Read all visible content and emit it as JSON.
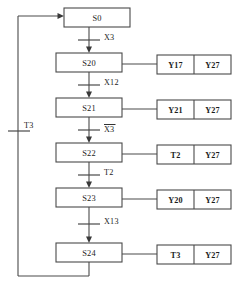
{
  "diagram": {
    "type": "sequential-function-chart",
    "title": "",
    "states": [
      {
        "id": "s0",
        "label": "S0",
        "x": 64,
        "y": 8,
        "w": 66,
        "h": 19
      },
      {
        "id": "s20",
        "label": "S20",
        "x": 56,
        "y": 53,
        "w": 66,
        "h": 19
      },
      {
        "id": "s21",
        "label": "S21",
        "x": 56,
        "y": 98,
        "w": 66,
        "h": 19
      },
      {
        "id": "s22",
        "label": "S22",
        "x": 56,
        "y": 143,
        "w": 66,
        "h": 19
      },
      {
        "id": "s23",
        "label": "S23",
        "x": 56,
        "y": 188,
        "w": 66,
        "h": 19
      },
      {
        "id": "s24",
        "label": "S24",
        "x": 56,
        "y": 243,
        "w": 66,
        "h": 19
      }
    ],
    "transitions": [
      {
        "id": "t-s0-s20",
        "label": "X3",
        "overbar": false,
        "bar_y": 40,
        "label_x": 104,
        "label_y": 40
      },
      {
        "id": "t-s20-s21",
        "label": "X12",
        "overbar": false,
        "bar_y": 85,
        "label_x": 104,
        "label_y": 85
      },
      {
        "id": "t-s21-s22",
        "label": "X3",
        "overbar": true,
        "bar_y": 130,
        "label_x": 104,
        "label_y": 131
      },
      {
        "id": "t-s22-s23",
        "label": "T2",
        "overbar": false,
        "bar_y": 175,
        "label_x": 104,
        "label_y": 175
      },
      {
        "id": "t-s23-s24",
        "label": "X13",
        "overbar": false,
        "bar_y": 224,
        "label_x": 104,
        "label_y": 224
      },
      {
        "id": "t-return",
        "label": "T3",
        "overbar": false,
        "bar_y": 131,
        "label_x": 26,
        "label_y": 128
      }
    ],
    "action_rows": [
      {
        "id": "a-s20",
        "for_state": "S20",
        "cells": [
          "Y17",
          "Y27"
        ],
        "x": 157,
        "y": 55,
        "w": 74,
        "h": 19
      },
      {
        "id": "a-s21",
        "for_state": "S21",
        "cells": [
          "Y21",
          "Y27"
        ],
        "x": 157,
        "y": 100,
        "w": 74,
        "h": 19
      },
      {
        "id": "a-s22",
        "for_state": "S22",
        "cells": [
          "T2",
          "Y27"
        ],
        "x": 157,
        "y": 145,
        "w": 74,
        "h": 19
      },
      {
        "id": "a-s23",
        "for_state": "S23",
        "cells": [
          "Y20",
          "Y27"
        ],
        "x": 157,
        "y": 190,
        "w": 74,
        "h": 19
      },
      {
        "id": "a-s24",
        "for_state": "S24",
        "cells": [
          "T3",
          "Y27"
        ],
        "x": 157,
        "y": 245,
        "w": 74,
        "h": 19
      }
    ],
    "colors": {
      "line": "#4a4a4a",
      "text": "#1c1c1c",
      "background": "#ffffff"
    }
  }
}
